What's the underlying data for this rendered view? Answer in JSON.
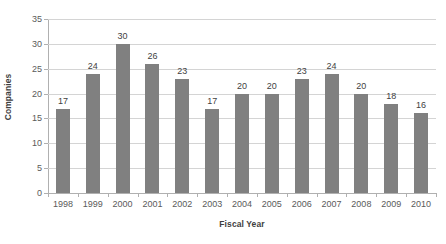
{
  "chart_data": {
    "type": "bar",
    "title": "",
    "subtitle": "",
    "xlabel": "Fiscal Year",
    "ylabel": "Companies",
    "categories": [
      "1998",
      "1999",
      "2000",
      "2001",
      "2002",
      "2003",
      "2004",
      "2005",
      "2006",
      "2007",
      "2008",
      "2009",
      "2010"
    ],
    "values": [
      17,
      24,
      30,
      26,
      23,
      17,
      20,
      20,
      23,
      24,
      20,
      18,
      16
    ],
    "data_labels": [
      "17",
      "24",
      "30",
      "26",
      "23",
      "17",
      "20",
      "20",
      "23",
      "24",
      "20",
      "18",
      "16"
    ],
    "ylim": [
      0,
      35
    ],
    "ytick_values": [
      0,
      5,
      10,
      15,
      20,
      25,
      30,
      35
    ],
    "ytick_labels": [
      "0",
      "5",
      "10",
      "15",
      "20",
      "25",
      "30",
      "35"
    ],
    "grid": true,
    "grid_axis": "y",
    "legend": false,
    "legend_position": "none",
    "bar_color": "#808080",
    "gridline_color": "#d4d4d4",
    "axis_color": "#b0b0b0",
    "background_color": "#ffffff",
    "text_color": "#3f3f3f"
  }
}
